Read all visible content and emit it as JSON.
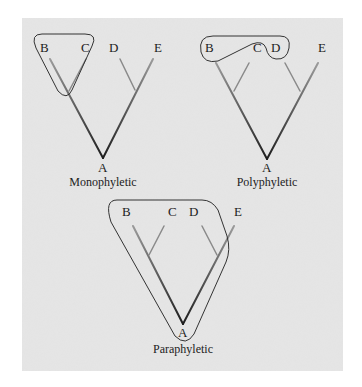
{
  "figure": {
    "background_color": "#d9d9d9",
    "branch_color": "#6a6a6a",
    "branch_dark_color": "#222222",
    "outline_color": "#333333"
  },
  "panels": [
    {
      "caption": "Monophyletic",
      "root": "A",
      "taxa": [
        "B",
        "C",
        "D",
        "E"
      ],
      "grouped": [
        "B",
        "C"
      ]
    },
    {
      "caption": "Polyphyletic",
      "root": "A",
      "taxa": [
        "B",
        "C",
        "D",
        "E"
      ],
      "grouped": [
        "B",
        "D"
      ]
    },
    {
      "caption": "Paraphyletic",
      "root": "A",
      "taxa": [
        "B",
        "C",
        "D",
        "E"
      ],
      "grouped": [
        "A",
        "B",
        "C",
        "D"
      ]
    }
  ]
}
